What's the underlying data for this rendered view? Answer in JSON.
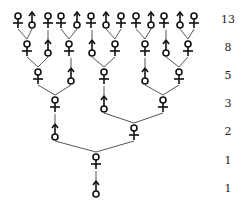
{
  "generations": [
    {
      "count": "13",
      "y": 20,
      "bees": [
        [
          "F",
          18
        ],
        [
          "M",
          32
        ],
        [
          "F",
          48
        ],
        [
          "F",
          61
        ],
        [
          "M",
          77
        ],
        [
          "F",
          91
        ],
        [
          "M",
          106
        ],
        [
          "F",
          121
        ],
        [
          "F",
          136
        ],
        [
          "M",
          151
        ],
        [
          "F",
          164
        ],
        [
          "M",
          180
        ],
        [
          "F",
          194
        ]
      ]
    },
    {
      "count": "8",
      "y": 48,
      "bees": [
        [
          "F",
          27
        ],
        [
          "M",
          48
        ],
        [
          "F",
          69
        ],
        [
          "M",
          92
        ],
        [
          "F",
          115
        ],
        [
          "F",
          145
        ],
        [
          "M",
          166
        ],
        [
          "F",
          188
        ]
      ]
    },
    {
      "count": "5",
      "y": 76,
      "bees": [
        [
          "F",
          38
        ],
        [
          "M",
          71
        ],
        [
          "F",
          104
        ],
        [
          "M",
          145
        ],
        [
          "F",
          179
        ]
      ]
    },
    {
      "count": "3",
      "y": 104,
      "bees": [
        [
          "F",
          55
        ],
        [
          "M",
          104
        ],
        [
          "F",
          163
        ]
      ]
    },
    {
      "count": "2",
      "y": 132,
      "bees": [
        [
          "M",
          55
        ],
        [
          "F",
          134
        ]
      ]
    },
    {
      "count": "1",
      "y": 161,
      "bees": [
        [
          "F",
          96
        ]
      ]
    },
    {
      "count": "1",
      "y": 189,
      "bees": [
        [
          "M",
          96
        ]
      ]
    }
  ],
  "links": [
    [
      1,
      0,
      [
        0,
        1
      ]
    ],
    [
      1,
      1,
      [
        2
      ]
    ],
    [
      1,
      2,
      [
        3,
        4
      ]
    ],
    [
      1,
      3,
      [
        5
      ]
    ],
    [
      1,
      4,
      [
        6,
        7
      ]
    ],
    [
      1,
      5,
      [
        8,
        9
      ]
    ],
    [
      1,
      6,
      [
        10
      ]
    ],
    [
      1,
      7,
      [
        11,
        12
      ]
    ],
    [
      2,
      0,
      [
        0,
        1
      ]
    ],
    [
      2,
      1,
      [
        2
      ]
    ],
    [
      2,
      2,
      [
        3,
        4
      ]
    ],
    [
      2,
      3,
      [
        5
      ]
    ],
    [
      2,
      4,
      [
        6,
        7
      ]
    ],
    [
      3,
      0,
      [
        0,
        1
      ]
    ],
    [
      3,
      1,
      [
        2
      ]
    ],
    [
      3,
      2,
      [
        3,
        4
      ]
    ],
    [
      4,
      0,
      [
        0
      ]
    ],
    [
      4,
      1,
      [
        1,
        2
      ]
    ],
    [
      5,
      0,
      [
        0,
        1
      ]
    ],
    [
      6,
      0,
      [
        0
      ]
    ]
  ]
}
